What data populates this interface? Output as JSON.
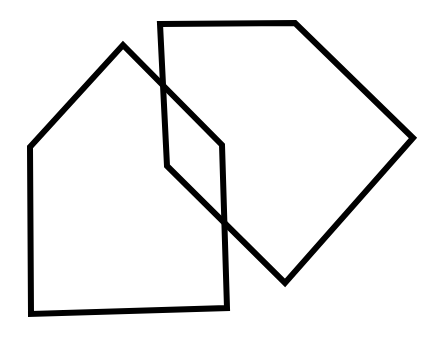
{
  "figure": {
    "background_color": "#ffffff",
    "stroke_color": "#000000",
    "stroke_width": 6,
    "canvas": {
      "width": 441,
      "height": 340
    },
    "shapes": [
      {
        "name": "house-pentagon",
        "description": "House-shaped pentagon on the left with a peaked roof",
        "vertex_count": 5,
        "closed": true,
        "fill": "none",
        "stroke_color": "#000000",
        "stroke_width": 6,
        "points": "30,147 123,45 222,145 227,308 31,314",
        "vertices": [
          {
            "label": "left-eave",
            "x": 30,
            "y": 147
          },
          {
            "label": "roof-apex",
            "x": 123,
            "y": 45
          },
          {
            "label": "right-eave",
            "x": 222,
            "y": 145
          },
          {
            "label": "bottom-right",
            "x": 227,
            "y": 308
          },
          {
            "label": "bottom-left",
            "x": 31,
            "y": 314
          }
        ]
      },
      {
        "name": "kite-pentagon",
        "description": "Kite or diamond-like pentagon on the right, rotated, overlapping the house",
        "vertex_count": 5,
        "closed": true,
        "fill": "none",
        "stroke_color": "#000000",
        "stroke_width": 6,
        "points": "160,24 295,23 413,138 285,283 167,166",
        "vertices": [
          {
            "label": "top-left",
            "x": 160,
            "y": 24
          },
          {
            "label": "top-right",
            "x": 295,
            "y": 23
          },
          {
            "label": "right-point",
            "x": 413,
            "y": 138
          },
          {
            "label": "bottom-point",
            "x": 285,
            "y": 283
          },
          {
            "label": "left-notch",
            "x": 167,
            "y": 166
          }
        ]
      }
    ],
    "intersections": [
      {
        "label": "upper-crossing",
        "x": 160,
        "y": 82
      },
      {
        "label": "mid-crossing",
        "x": 193,
        "y": 116
      },
      {
        "label": "lower-crossing",
        "x": 222,
        "y": 213
      }
    ]
  }
}
